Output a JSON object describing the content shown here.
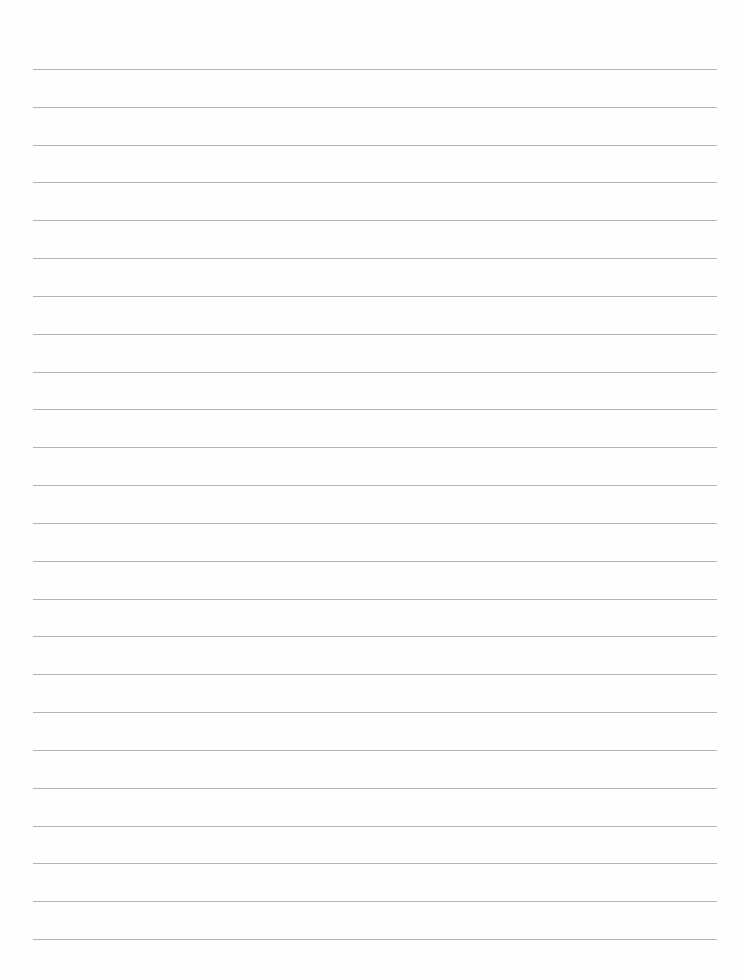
{
  "page": {
    "type": "lined-paper",
    "background_color": "#fefefe",
    "line_color": "#b4b4b4",
    "line_count": 24,
    "first_line_y": 69,
    "line_spacing": 37.83,
    "margin_left": 33,
    "margin_right": 27
  }
}
